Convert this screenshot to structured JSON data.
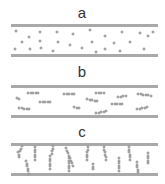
{
  "panels": [
    {
      "label": "a",
      "label_pos": [
        82,
        5
      ],
      "bars_y": [
        24,
        54
      ],
      "state": "dispersed single particles",
      "dots": [
        [
          16,
          31
        ],
        [
          29,
          37
        ],
        [
          40,
          32
        ],
        [
          57,
          32
        ],
        [
          73,
          34
        ],
        [
          90,
          30
        ],
        [
          105,
          36
        ],
        [
          122,
          32
        ],
        [
          140,
          33
        ],
        [
          148,
          36
        ],
        [
          153,
          32
        ],
        [
          22,
          42
        ],
        [
          40,
          41
        ],
        [
          58,
          42
        ],
        [
          70,
          45
        ],
        [
          92,
          42
        ],
        [
          114,
          43
        ],
        [
          130,
          42
        ],
        [
          15,
          49
        ],
        [
          30,
          49
        ],
        [
          41,
          48
        ],
        [
          53,
          51
        ],
        [
          82,
          48
        ],
        [
          96,
          52
        ],
        [
          105,
          49
        ],
        [
          120,
          51
        ],
        [
          144,
          49
        ]
      ]
    },
    {
      "label": "b",
      "label_pos": [
        82,
        64
      ],
      "bars_y": [
        85,
        115
      ],
      "state": "short randomly oriented chains",
      "chains": [
        {
          "x": 28,
          "y": 93,
          "n": 5,
          "dx": 2.5,
          "dy": 0
        },
        {
          "x": 17,
          "y": 98,
          "n": 2,
          "dx": 2,
          "dy": 1
        },
        {
          "x": 40,
          "y": 102,
          "n": 5,
          "dx": 2.5,
          "dy": 0
        },
        {
          "x": 64,
          "y": 94,
          "n": 5,
          "dx": 2.5,
          "dy": 0
        },
        {
          "x": 96,
          "y": 93,
          "n": 4,
          "dx": 2.5,
          "dy": 0
        },
        {
          "x": 87,
          "y": 99,
          "n": 5,
          "dx": 2.5,
          "dy": 0.6
        },
        {
          "x": 118,
          "y": 97,
          "n": 4,
          "dx": 2.5,
          "dy": -0.5
        },
        {
          "x": 112,
          "y": 104,
          "n": 5,
          "dx": 2.5,
          "dy": 0
        },
        {
          "x": 138,
          "y": 94,
          "n": 6,
          "dx": 2.5,
          "dy": 0.3
        },
        {
          "x": 19,
          "y": 108,
          "n": 5,
          "dx": 2.5,
          "dy": 0.3
        },
        {
          "x": 74,
          "y": 107,
          "n": 3,
          "dx": 2.5,
          "dy": 0.5
        },
        {
          "x": 96,
          "y": 113,
          "n": 5,
          "dx": 2.5,
          "dy": -0.5
        },
        {
          "x": 137,
          "y": 109,
          "n": 5,
          "dx": 2.5,
          "dy": -0.5
        }
      ]
    },
    {
      "label": "c",
      "label_pos": [
        82,
        124
      ],
      "bars_y": [
        143,
        173
      ],
      "state": "chains aligned across gap",
      "chains": [
        {
          "x": 22,
          "y": 146,
          "n": 3,
          "dx": -1.2,
          "dy": 2.5
        },
        {
          "x": 18,
          "y": 152,
          "n": 3,
          "dx": 0.5,
          "dy": 2.5
        },
        {
          "x": 35,
          "y": 147,
          "n": 6,
          "dx": 0,
          "dy": 2.5
        },
        {
          "x": 26,
          "y": 161,
          "n": 6,
          "dx": 0.5,
          "dy": 2.5
        },
        {
          "x": 53,
          "y": 146,
          "n": 4,
          "dx": -0.5,
          "dy": 2.5
        },
        {
          "x": 50,
          "y": 156,
          "n": 6,
          "dx": 0,
          "dy": 2.5
        },
        {
          "x": 66,
          "y": 148,
          "n": 8,
          "dx": 1,
          "dy": 2.5
        },
        {
          "x": 69,
          "y": 158,
          "n": 6,
          "dx": 0,
          "dy": 2.5
        },
        {
          "x": 88,
          "y": 147,
          "n": 6,
          "dx": -0.3,
          "dy": 2.5
        },
        {
          "x": 93,
          "y": 164,
          "n": 3,
          "dx": 0,
          "dy": 2.5
        },
        {
          "x": 104,
          "y": 147,
          "n": 6,
          "dx": 0.4,
          "dy": 2.5
        },
        {
          "x": 119,
          "y": 158,
          "n": 6,
          "dx": 0,
          "dy": 2.5
        },
        {
          "x": 129,
          "y": 147,
          "n": 6,
          "dx": 0.2,
          "dy": 2.5
        },
        {
          "x": 137,
          "y": 162,
          "n": 5,
          "dx": 0.2,
          "dy": 2.5
        },
        {
          "x": 148,
          "y": 153,
          "n": 5,
          "dx": 0,
          "dy": 2.5
        }
      ]
    }
  ]
}
